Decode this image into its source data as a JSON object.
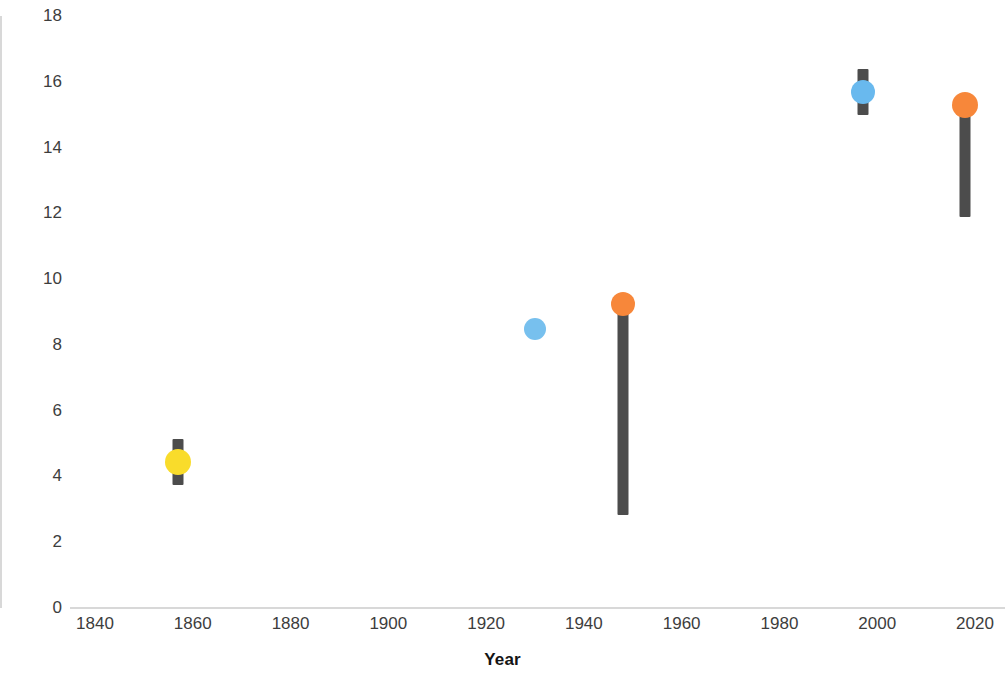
{
  "chart_data": {
    "type": "scatter",
    "title": "",
    "xlabel": "Year",
    "ylabel": "Percent Cover",
    "xlim": [
      1835,
      2025
    ],
    "ylim": [
      0,
      18
    ],
    "xticks": [
      1840,
      1860,
      1880,
      1900,
      1920,
      1940,
      1960,
      1980,
      2000,
      2020
    ],
    "yticks": [
      0,
      2,
      4,
      6,
      8,
      10,
      12,
      14,
      16,
      18
    ],
    "grid": false,
    "legend": "none",
    "errorbar_color": "#4c4c4c",
    "axis_color": "#d8d8d8",
    "points": [
      {
        "label": "point-1857",
        "year": 1857,
        "value": 4.4,
        "color": "#F9DC2B",
        "radius": 13,
        "error_low": 3.7,
        "error_high": 5.1,
        "has_errorbar": true
      },
      {
        "label": "point-1930",
        "year": 1930,
        "value": 8.45,
        "color": "#77C0EE",
        "radius": 11,
        "error_low": 8.45,
        "error_high": 8.45,
        "has_errorbar": false
      },
      {
        "label": "point-1948",
        "year": 1948,
        "value": 9.2,
        "color": "#F7873A",
        "radius": 12,
        "error_low": 2.8,
        "error_high": 9.5,
        "has_errorbar": true
      },
      {
        "label": "point-1997",
        "year": 1997,
        "value": 15.65,
        "color": "#69B9EE",
        "radius": 12,
        "error_low": 14.95,
        "error_high": 16.35,
        "has_errorbar": true
      },
      {
        "label": "point-2018",
        "year": 2018,
        "value": 15.25,
        "color": "#F7873A",
        "radius": 13,
        "error_low": 11.85,
        "error_high": 15.4,
        "has_errorbar": true
      }
    ]
  }
}
